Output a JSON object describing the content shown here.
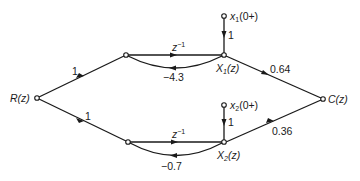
{
  "diagram": {
    "type": "signal-flow-graph",
    "nodes": {
      "R": {
        "label": "R(z)"
      },
      "U1": {
        "label": ""
      },
      "X1": {
        "label_main": "X",
        "label_sub": "1",
        "label_tail": "(z)"
      },
      "x1init": {
        "label_main": "x",
        "label_sub": "1",
        "label_tail": "(0+)"
      },
      "U2": {
        "label": ""
      },
      "X2": {
        "label_main": "X",
        "label_sub": "2",
        "label_tail": "(z)"
      },
      "x2init": {
        "label_main": "x",
        "label_sub": "2",
        "label_tail": "(0+)"
      },
      "C": {
        "label": "C(z)"
      }
    },
    "edges": {
      "R_U1": {
        "gain": "1"
      },
      "R_U2": {
        "gain": "1"
      },
      "U1_X1": {
        "gain_main": "z",
        "gain_sup": "−1"
      },
      "X1_U1": {
        "gain": "−4.3"
      },
      "x1init_X1": {
        "gain": "1"
      },
      "X1_C": {
        "gain": "0.64"
      },
      "U2_X2": {
        "gain_main": "z",
        "gain_sup": "−1"
      },
      "X2_U2": {
        "gain": "−0.7"
      },
      "x2init_X2": {
        "gain": "1"
      },
      "X2_C": {
        "gain": "0.36"
      }
    }
  }
}
